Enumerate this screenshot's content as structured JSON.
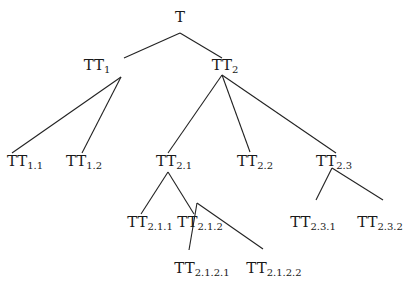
{
  "diagram": {
    "type": "tree",
    "root": "T",
    "nodes": [
      {
        "id": "T",
        "base": "T",
        "sub": "",
        "x": 180,
        "y": 22
      },
      {
        "id": "TT1",
        "base": "TT",
        "sub": "1",
        "x": 97,
        "y": 70
      },
      {
        "id": "TT2",
        "base": "TT",
        "sub": "2",
        "x": 225,
        "y": 70
      },
      {
        "id": "TT1.1",
        "base": "TT",
        "sub": "1.1",
        "x": 25,
        "y": 166
      },
      {
        "id": "TT1.2",
        "base": "TT",
        "sub": "1.2",
        "x": 84,
        "y": 166
      },
      {
        "id": "TT2.1",
        "base": "TT",
        "sub": "2.1",
        "x": 174,
        "y": 166
      },
      {
        "id": "TT2.2",
        "base": "TT",
        "sub": "2.2",
        "x": 255,
        "y": 166
      },
      {
        "id": "TT2.3",
        "base": "TT",
        "sub": "2.3",
        "x": 334,
        "y": 166
      },
      {
        "id": "TT2.1.1",
        "base": "TT",
        "sub": "2.1.1",
        "x": 150,
        "y": 227
      },
      {
        "id": "TT2.1.2",
        "base": "TT",
        "sub": "2.1.2",
        "x": 200,
        "y": 227
      },
      {
        "id": "TT2.3.1",
        "base": "TT",
        "sub": "2.3.1",
        "x": 313,
        "y": 227
      },
      {
        "id": "TT2.3.2",
        "base": "TT",
        "sub": "2.3.2",
        "x": 380,
        "y": 227
      },
      {
        "id": "TT2.1.2.1",
        "base": "TT",
        "sub": "2.1.2.1",
        "x": 202,
        "y": 273
      },
      {
        "id": "TT2.1.2.2",
        "base": "TT",
        "sub": "2.1.2.2",
        "x": 274,
        "y": 273
      }
    ],
    "edges": [
      {
        "from": "T",
        "to": "TT1",
        "x1": 180,
        "y1": 33,
        "x2": 124,
        "y2": 58
      },
      {
        "from": "T",
        "to": "TT2",
        "x1": 180,
        "y1": 33,
        "x2": 222,
        "y2": 58
      },
      {
        "from": "TT1",
        "to": "TT1.1",
        "x1": 121,
        "y1": 77,
        "x2": 12,
        "y2": 153
      },
      {
        "from": "TT1",
        "to": "TT1.2",
        "x1": 121,
        "y1": 77,
        "x2": 82,
        "y2": 153
      },
      {
        "from": "TT2",
        "to": "TT2.1",
        "x1": 222,
        "y1": 75,
        "x2": 168,
        "y2": 153
      },
      {
        "from": "TT2",
        "to": "TT2.2",
        "x1": 222,
        "y1": 75,
        "x2": 250,
        "y2": 152
      },
      {
        "from": "TT2",
        "to": "TT2.3",
        "x1": 222,
        "y1": 75,
        "x2": 336,
        "y2": 153
      },
      {
        "from": "TT2.1",
        "to": "TT2.1.1",
        "x1": 168,
        "y1": 172,
        "x2": 141,
        "y2": 214
      },
      {
        "from": "TT2.1",
        "to": "TT2.1.2",
        "x1": 168,
        "y1": 172,
        "x2": 194,
        "y2": 214
      },
      {
        "from": "TT2.3",
        "to": "TT2.3.1",
        "x1": 332,
        "y1": 168,
        "x2": 316,
        "y2": 200
      },
      {
        "from": "TT2.3",
        "to": "TT2.3.2",
        "x1": 332,
        "y1": 168,
        "x2": 383,
        "y2": 200
      },
      {
        "from": "TT2.1.2",
        "to": "TT2.1.2.1",
        "x1": 197,
        "y1": 203,
        "x2": 189,
        "y2": 250
      },
      {
        "from": "TT2.1.2",
        "to": "TT2.1.2.2",
        "x1": 197,
        "y1": 203,
        "x2": 263,
        "y2": 249
      }
    ]
  }
}
